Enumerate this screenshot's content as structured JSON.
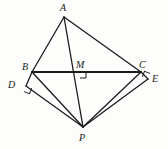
{
  "figure": {
    "stroke_color": "#1b1b1b",
    "background_color": "#fdfdfc",
    "canvas": {
      "width": 168,
      "height": 149
    }
  },
  "points": {
    "A": {
      "label": "A",
      "x": 64,
      "y": 17,
      "label_x": 60,
      "label_y": 3
    },
    "B": {
      "label": "B",
      "x": 32,
      "y": 72,
      "label_x": 22,
      "label_y": 62
    },
    "C": {
      "label": "C",
      "x": 141,
      "y": 72,
      "label_x": 139,
      "label_y": 60
    },
    "D": {
      "label": "D",
      "x": 26,
      "y": 86,
      "label_x": 8,
      "label_y": 80
    },
    "E": {
      "label": "E",
      "x": 148,
      "y": 79,
      "label_x": 152,
      "label_y": 74
    },
    "M": {
      "label": "M",
      "x": 80,
      "y": 72,
      "label_x": 76,
      "label_y": 60
    },
    "P": {
      "label": "P",
      "x": 83,
      "y": 127,
      "label_x": 79,
      "label_y": 133
    }
  },
  "segments": [
    {
      "name": "AB",
      "from": "A",
      "to": "B",
      "weight": 1.3
    },
    {
      "name": "AC",
      "from": "A",
      "to": "C",
      "weight": 1.3
    },
    {
      "name": "AP",
      "from": "A",
      "to": "P",
      "weight": 1.3
    },
    {
      "name": "BC",
      "from": "B",
      "to": "C",
      "weight": 2.2
    },
    {
      "name": "BD",
      "from": "B",
      "to": "D",
      "weight": 1.3
    },
    {
      "name": "BP",
      "from": "B",
      "to": "P",
      "weight": 1.3
    },
    {
      "name": "DP",
      "from": "D",
      "to": "P",
      "weight": 1.3
    },
    {
      "name": "CE",
      "from": "C",
      "to": "E",
      "weight": 1.3
    },
    {
      "name": "CP",
      "from": "C",
      "to": "P",
      "weight": 1.3
    },
    {
      "name": "EP",
      "from": "E",
      "to": "P",
      "weight": 1.3
    }
  ],
  "right_angles": [
    {
      "name": "right-angle-at-M",
      "vertex": "M",
      "size": 6,
      "rotation": 0,
      "x": 80,
      "y": 72
    },
    {
      "name": "right-angle-at-D",
      "vertex": "D",
      "size": 6,
      "rotation": 20,
      "x": 26,
      "y": 86
    },
    {
      "name": "right-angle-at-E",
      "vertex": "E",
      "size": 6,
      "rotation": 200,
      "x": 148,
      "y": 79
    }
  ]
}
